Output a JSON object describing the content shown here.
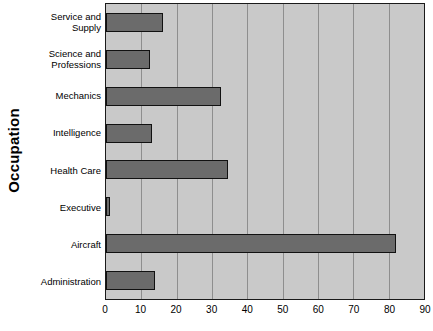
{
  "chart_data": {
    "type": "bar",
    "orientation": "horizontal",
    "title": "",
    "xlabel": "",
    "ylabel": "Occupation",
    "xlim": [
      0,
      90
    ],
    "xticks": [
      0,
      10,
      20,
      30,
      40,
      50,
      60,
      70,
      80,
      90
    ],
    "grid": true,
    "legend": false,
    "categories": [
      "Service and Supply",
      "Science and Professions",
      "Mechanics",
      "Intelligence",
      "Health Care",
      "Executive",
      "Aircraft",
      "Administration"
    ],
    "values": [
      16,
      12.5,
      32.5,
      13,
      34.5,
      1.2,
      82,
      14
    ],
    "colors": {
      "bar_fill": "#6b6b6b",
      "bar_border": "#111111",
      "plot_background": "#c9c9c9",
      "gridline": "#8e8e8e",
      "axis": "#1a1a1a",
      "text": "#000000",
      "page_background": "#ffffff"
    }
  }
}
